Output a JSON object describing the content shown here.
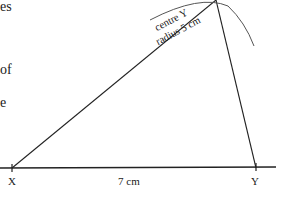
{
  "diagram": {
    "type": "geometric-construction",
    "left_text_fragments": [
      "es",
      "of",
      "e"
    ],
    "points": {
      "X": {
        "label": "X",
        "x": 12,
        "y": 168
      },
      "Y": {
        "label": "Y",
        "x": 256,
        "y": 168
      },
      "apex": {
        "label": "",
        "x": 216,
        "y": 0
      }
    },
    "segment_XY": {
      "length_label": "7 cm"
    },
    "arc": {
      "line1": "centre Y",
      "line2": "radius 5 cm"
    },
    "colors": {
      "line": "#222222",
      "arc": "#555555",
      "background": "#ffffff"
    }
  }
}
